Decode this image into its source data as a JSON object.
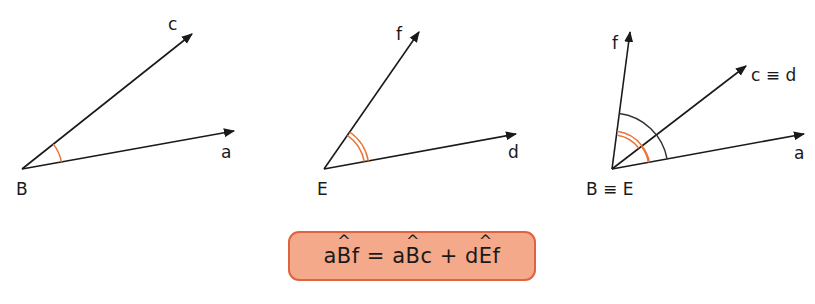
{
  "colors": {
    "line": "#1a1a1a",
    "arc_orange": "#e8743b",
    "arc_dark": "#333333",
    "box_fill": "#f3a98a",
    "box_border": "#e0633f"
  },
  "figures": [
    {
      "id": "angle-aBc",
      "vertex_label": "B",
      "rays": [
        {
          "label": "c"
        },
        {
          "label": "a"
        }
      ],
      "arc": "single orange"
    },
    {
      "id": "angle-dEf",
      "vertex_label": "E",
      "rays": [
        {
          "label": "f"
        },
        {
          "label": "d"
        }
      ],
      "arc": "double orange"
    },
    {
      "id": "angle-sum",
      "vertex_label": "B ≡ E",
      "rays": [
        {
          "label": "f"
        },
        {
          "label": "c ≡ d"
        },
        {
          "label": "a"
        }
      ],
      "arcs": [
        "single orange (aBc)",
        "double orange (dEf)",
        "dark (aBf)"
      ]
    }
  ],
  "formula": {
    "lhs_pre": "a",
    "lhs_vertex": "B",
    "lhs_post": "f",
    "equals": "=",
    "t1_pre": "a",
    "t1_vertex": "B",
    "t1_post": "c",
    "plus": "+",
    "t2_pre": "d",
    "t2_vertex": "E",
    "t2_post": "f",
    "full_text": "aB̂f = aB̂c + dÊf"
  }
}
